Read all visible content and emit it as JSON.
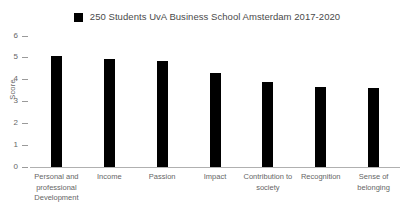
{
  "chart_data": {
    "type": "bar",
    "title": "",
    "xlabel": "",
    "ylabel": "Score",
    "ylim": [
      0,
      6
    ],
    "yticks": [
      6,
      5,
      4,
      3,
      2,
      1,
      0
    ],
    "grid": false,
    "legend_position": "top-center",
    "bar_color": "#000000",
    "categories": [
      "Personal and professional Development",
      "Income",
      "Passion",
      "Impact",
      "Contribution to society",
      "Recognition",
      "Sense of belonging"
    ],
    "series": [
      {
        "name": "250 Students UvA Business School Amsterdam 2017-2020",
        "values": [
          5.1,
          4.95,
          4.85,
          4.3,
          3.9,
          3.65,
          3.6
        ]
      }
    ]
  },
  "legend": {
    "label": "250 Students UvA Business School Amsterdam 2017-2020",
    "swatch_color": "#000000"
  },
  "axes": {
    "y_title": "Score",
    "y_tick_labels": [
      "6",
      "5",
      "4",
      "3",
      "2",
      "1",
      "0"
    ],
    "x_tick_labels": [
      "Personal and professional Development",
      "Income",
      "Passion",
      "Impact",
      "Contribution to society",
      "Recognition",
      "Sense of belonging"
    ]
  }
}
